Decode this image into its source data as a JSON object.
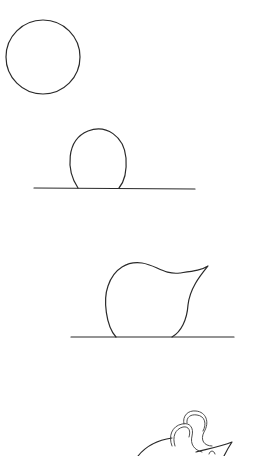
{
  "diagram": {
    "type": "step-by-step drawing tutorial",
    "colors": {
      "background": "#ffffff",
      "stroke": "#2a2a2a"
    },
    "steps": [
      {
        "index": 1,
        "description": "circle"
      },
      {
        "index": 2,
        "description": "circle on ground line"
      },
      {
        "index": 3,
        "description": "body with pointed snout on ground line"
      },
      {
        "index": 4,
        "description": "body with ears added (partially visible)"
      }
    ]
  }
}
